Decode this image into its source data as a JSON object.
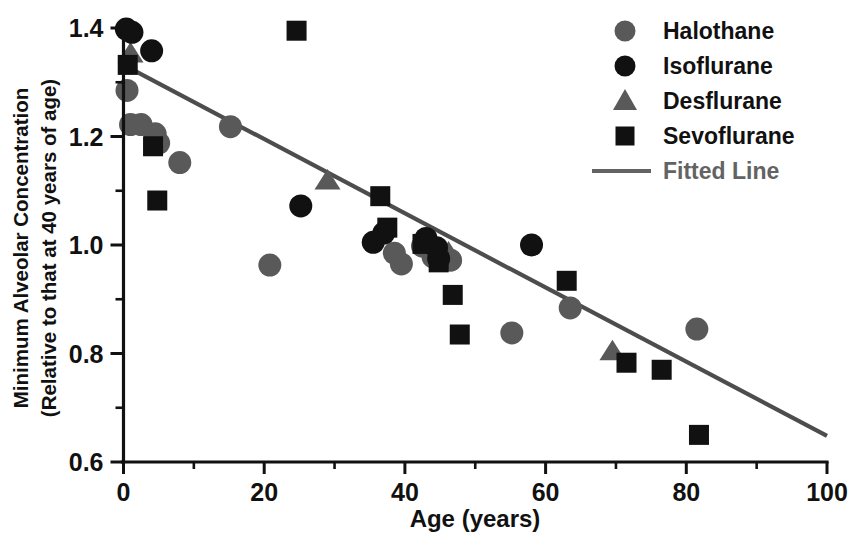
{
  "chart_data": {
    "type": "scatter",
    "title": "",
    "xlabel": "Age (years)",
    "ylabel_line1": "Minimum Alveolar Concentration",
    "ylabel_line2": "(Relative to that at 40 years of age)",
    "xlim": [
      0,
      100
    ],
    "ylim": [
      0.6,
      1.4
    ],
    "xticks": [
      0,
      20,
      40,
      60,
      80,
      100
    ],
    "xticklabels": [
      "0",
      "20",
      "40",
      "60",
      "80",
      "100"
    ],
    "xminorticks": [
      10,
      30,
      50,
      70,
      90
    ],
    "yticks": [
      0.6,
      0.8,
      1.0,
      1.2,
      1.4
    ],
    "yticklabels": [
      "0.6",
      "0.8",
      "1.0",
      "1.2",
      "1.4"
    ],
    "yminorticks": [
      0.7,
      0.9,
      1.1,
      1.3
    ],
    "grid": false,
    "legend_position": "top-right",
    "series": [
      {
        "name": "Halothane",
        "marker": "circle",
        "color": "#595959",
        "points": [
          [
            0.5,
            1.285
          ],
          [
            1.0,
            1.222
          ],
          [
            2.5,
            1.222
          ],
          [
            4.5,
            1.205
          ],
          [
            5.0,
            1.188
          ],
          [
            8.0,
            1.152
          ],
          [
            15.2,
            1.218
          ],
          [
            20.8,
            0.963
          ],
          [
            38.5,
            0.985
          ],
          [
            39.5,
            0.965
          ],
          [
            42.5,
            0.998
          ],
          [
            44.0,
            0.978
          ],
          [
            46.5,
            0.972
          ],
          [
            55.2,
            0.838
          ],
          [
            63.5,
            0.884
          ],
          [
            81.5,
            0.845
          ]
        ]
      },
      {
        "name": "Isoflurane",
        "marker": "circle",
        "color": "#111111",
        "points": [
          [
            0.4,
            1.398
          ],
          [
            1.2,
            1.392
          ],
          [
            4.0,
            1.358
          ],
          [
            25.2,
            1.072
          ],
          [
            35.5,
            1.005
          ],
          [
            37.0,
            1.022
          ],
          [
            43.0,
            1.012
          ],
          [
            44.5,
            0.995
          ],
          [
            44.8,
            0.975
          ],
          [
            58.0,
            1.0
          ]
        ]
      },
      {
        "name": "Desflurane",
        "marker": "triangle",
        "color": "#595959",
        "points": [
          [
            1.0,
            1.352
          ],
          [
            29.0,
            1.118
          ],
          [
            46.2,
            0.985
          ],
          [
            69.5,
            0.803
          ]
        ]
      },
      {
        "name": "Sevoflurane",
        "marker": "square",
        "color": "#111111",
        "points": [
          [
            0.6,
            1.332
          ],
          [
            4.2,
            1.182
          ],
          [
            4.8,
            1.082
          ],
          [
            24.6,
            1.395
          ],
          [
            36.5,
            1.09
          ],
          [
            37.5,
            1.032
          ],
          [
            42.5,
            1.002
          ],
          [
            44.8,
            0.968
          ],
          [
            46.8,
            0.908
          ],
          [
            47.8,
            0.835
          ],
          [
            63.0,
            0.934
          ],
          [
            71.5,
            0.783
          ],
          [
            76.5,
            0.77
          ],
          [
            81.8,
            0.65
          ]
        ]
      }
    ],
    "fitted_line": {
      "name": "Fitted Line",
      "color": "#4d4d4d",
      "x_start": 0,
      "y_start": 1.332,
      "x_end": 100,
      "y_end": 0.648
    }
  },
  "legend": {
    "entries": [
      {
        "label": "Halothane",
        "marker": "circle",
        "color": "#595959"
      },
      {
        "label": "Isoflurane",
        "marker": "circle",
        "color": "#111111"
      },
      {
        "label": "Desflurane",
        "marker": "triangle",
        "color": "#595959"
      },
      {
        "label": "Sevoflurane",
        "marker": "square",
        "color": "#111111"
      },
      {
        "label": "Fitted Line",
        "marker": "line",
        "color": "#636363"
      }
    ]
  }
}
